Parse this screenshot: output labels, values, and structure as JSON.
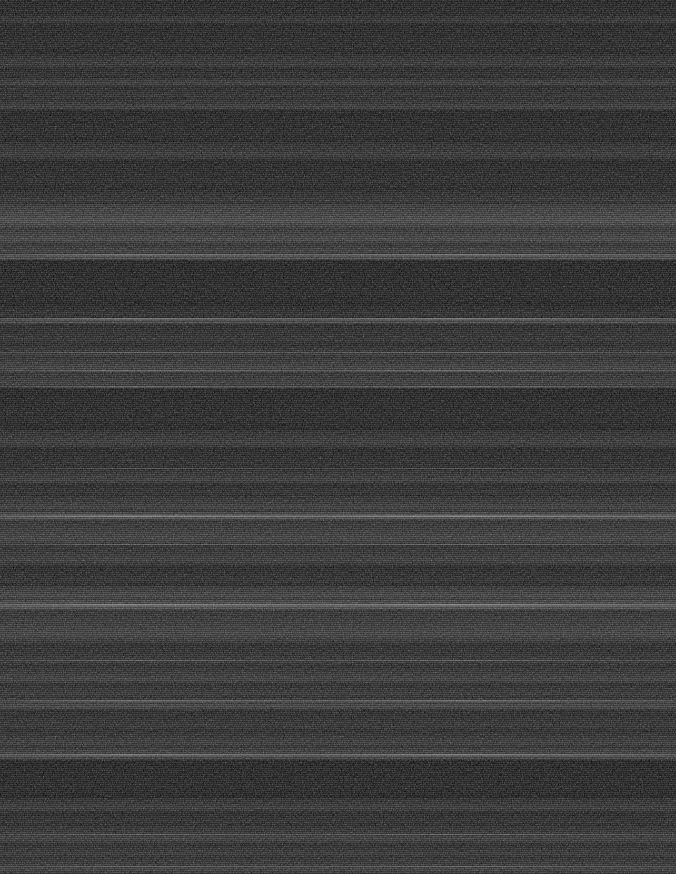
{
  "image": {
    "kind": "noise-band-texture",
    "width": 676,
    "height": 874,
    "description": "Near-black image composed of horizontal bands of granular noise of varying intensity, crossed by thin bright horizontal streaks.",
    "background_color": "#000000",
    "base_plate_color": "#020202",
    "peak_luminance": 75,
    "floor_luminance": 2,
    "text_content": "",
    "ui_elements_present": "none"
  },
  "chart_data": {
    "type": "heatmap",
    "title": "",
    "subtitle": "",
    "xlabel": "",
    "ylabel": "",
    "legend": [],
    "grid": false,
    "orientation": "horizontal-bands",
    "x": [
      0,
      676
    ],
    "ylim": [
      0,
      874
    ],
    "value_range": [
      0,
      75
    ],
    "colormap": "grayscale-black-to-dim-gray",
    "note": "Each band is a horizontal row-range with a mean grayscale level (0-255) and a grain amplitude; values estimated from pixel inspection.",
    "bands": [
      {
        "y": 0,
        "height": 14,
        "level": 4,
        "grain": 6,
        "name": "band-top-edge"
      },
      {
        "y": 14,
        "height": 10,
        "level": 16,
        "grain": 14,
        "name": "band-001"
      },
      {
        "y": 24,
        "height": 30,
        "level": 6,
        "grain": 7,
        "name": "band-002"
      },
      {
        "y": 54,
        "height": 14,
        "level": 19,
        "grain": 15,
        "name": "band-003"
      },
      {
        "y": 68,
        "height": 10,
        "level": 10,
        "grain": 9,
        "name": "band-004"
      },
      {
        "y": 78,
        "height": 8,
        "level": 26,
        "grain": 18,
        "name": "band-005-bright"
      },
      {
        "y": 86,
        "height": 14,
        "level": 14,
        "grain": 12,
        "name": "band-006"
      },
      {
        "y": 100,
        "height": 10,
        "level": 24,
        "grain": 17,
        "name": "band-007"
      },
      {
        "y": 110,
        "height": 32,
        "level": 5,
        "grain": 6,
        "name": "band-008-dark-gap"
      },
      {
        "y": 142,
        "height": 18,
        "level": 20,
        "grain": 15,
        "name": "band-009"
      },
      {
        "y": 160,
        "height": 30,
        "level": 7,
        "grain": 7,
        "name": "band-010"
      },
      {
        "y": 190,
        "height": 14,
        "level": 16,
        "grain": 13,
        "name": "band-011"
      },
      {
        "y": 204,
        "height": 24,
        "level": 40,
        "grain": 24,
        "name": "band-012-brightest"
      },
      {
        "y": 228,
        "height": 16,
        "level": 34,
        "grain": 22,
        "name": "band-013-bright"
      },
      {
        "y": 244,
        "height": 10,
        "level": 28,
        "grain": 19,
        "name": "band-014"
      },
      {
        "y": 254,
        "height": 6,
        "level": 46,
        "grain": 20,
        "name": "band-015-streak-edge"
      },
      {
        "y": 260,
        "height": 46,
        "level": 4,
        "grain": 5,
        "name": "band-016-dark-gap"
      },
      {
        "y": 306,
        "height": 12,
        "level": 12,
        "grain": 11,
        "name": "band-017"
      },
      {
        "y": 318,
        "height": 6,
        "level": 40,
        "grain": 16,
        "name": "band-018-streak"
      },
      {
        "y": 324,
        "height": 22,
        "level": 14,
        "grain": 12,
        "name": "band-019"
      },
      {
        "y": 346,
        "height": 12,
        "level": 22,
        "grain": 16,
        "name": "band-020"
      },
      {
        "y": 358,
        "height": 14,
        "level": 30,
        "grain": 20,
        "name": "band-021"
      },
      {
        "y": 372,
        "height": 16,
        "level": 26,
        "grain": 18,
        "name": "band-022"
      },
      {
        "y": 388,
        "height": 42,
        "level": 5,
        "grain": 6,
        "name": "band-023-dark-gap"
      },
      {
        "y": 430,
        "height": 18,
        "level": 22,
        "grain": 17,
        "name": "band-024"
      },
      {
        "y": 448,
        "height": 22,
        "level": 9,
        "grain": 9,
        "name": "band-025"
      },
      {
        "y": 470,
        "height": 14,
        "level": 24,
        "grain": 17,
        "name": "band-026"
      },
      {
        "y": 484,
        "height": 12,
        "level": 12,
        "grain": 10,
        "name": "band-027"
      },
      {
        "y": 496,
        "height": 16,
        "level": 26,
        "grain": 19,
        "name": "band-028"
      },
      {
        "y": 512,
        "height": 8,
        "level": 50,
        "grain": 22,
        "name": "band-029-bright-streak"
      },
      {
        "y": 520,
        "height": 26,
        "level": 30,
        "grain": 21,
        "name": "band-030"
      },
      {
        "y": 546,
        "height": 20,
        "level": 24,
        "grain": 18,
        "name": "band-031"
      },
      {
        "y": 566,
        "height": 20,
        "level": 12,
        "grain": 11,
        "name": "band-032"
      },
      {
        "y": 586,
        "height": 14,
        "level": 34,
        "grain": 22,
        "name": "band-033"
      },
      {
        "y": 600,
        "height": 10,
        "level": 52,
        "grain": 24,
        "name": "band-034-brightest-streak"
      },
      {
        "y": 610,
        "height": 34,
        "level": 30,
        "grain": 22,
        "name": "band-035"
      },
      {
        "y": 644,
        "height": 24,
        "level": 18,
        "grain": 15,
        "name": "band-036"
      },
      {
        "y": 668,
        "height": 16,
        "level": 28,
        "grain": 20,
        "name": "band-037"
      },
      {
        "y": 684,
        "height": 14,
        "level": 20,
        "grain": 15,
        "name": "band-038"
      },
      {
        "y": 698,
        "height": 12,
        "level": 34,
        "grain": 22,
        "name": "band-039"
      },
      {
        "y": 710,
        "height": 22,
        "level": 16,
        "grain": 13,
        "name": "band-040"
      },
      {
        "y": 732,
        "height": 16,
        "level": 24,
        "grain": 18,
        "name": "band-041"
      },
      {
        "y": 748,
        "height": 12,
        "level": 38,
        "grain": 22,
        "name": "band-042-streak"
      },
      {
        "y": 760,
        "height": 38,
        "level": 4,
        "grain": 5,
        "name": "band-043-dark-gap"
      },
      {
        "y": 798,
        "height": 14,
        "level": 22,
        "grain": 17,
        "name": "band-044"
      },
      {
        "y": 812,
        "height": 14,
        "level": 12,
        "grain": 11,
        "name": "band-045"
      },
      {
        "y": 826,
        "height": 18,
        "level": 26,
        "grain": 19,
        "name": "band-046"
      },
      {
        "y": 844,
        "height": 14,
        "level": 20,
        "grain": 16,
        "name": "band-047"
      },
      {
        "y": 858,
        "height": 16,
        "level": 28,
        "grain": 20,
        "name": "band-048-bottom-edge"
      }
    ],
    "streaks": [
      {
        "y": 254,
        "height": 2,
        "level": 64,
        "name": "streak-254"
      },
      {
        "y": 318,
        "height": 2,
        "level": 70,
        "name": "streak-318"
      },
      {
        "y": 352,
        "height": 1,
        "level": 52,
        "name": "streak-352"
      },
      {
        "y": 370,
        "height": 2,
        "level": 58,
        "name": "streak-370"
      },
      {
        "y": 386,
        "height": 2,
        "level": 56,
        "name": "streak-386"
      },
      {
        "y": 468,
        "height": 1,
        "level": 50,
        "name": "streak-468"
      },
      {
        "y": 515,
        "height": 2,
        "level": 75,
        "name": "streak-515"
      },
      {
        "y": 544,
        "height": 1,
        "level": 54,
        "name": "streak-544"
      },
      {
        "y": 604,
        "height": 2,
        "level": 72,
        "name": "streak-604"
      },
      {
        "y": 660,
        "height": 1,
        "level": 52,
        "name": "streak-660"
      },
      {
        "y": 700,
        "height": 2,
        "level": 60,
        "name": "streak-700"
      },
      {
        "y": 754,
        "height": 2,
        "level": 66,
        "name": "streak-754"
      },
      {
        "y": 834,
        "height": 1,
        "level": 50,
        "name": "streak-834"
      },
      {
        "y": 866,
        "height": 1,
        "level": 48,
        "name": "streak-866"
      }
    ]
  }
}
